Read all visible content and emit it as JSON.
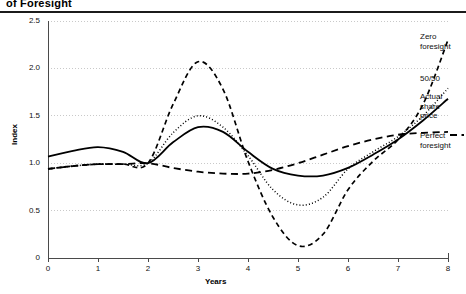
{
  "title": "of Foresight",
  "axes": {
    "xlabel": "Years",
    "ylabel": "Index",
    "yticks": [
      "0",
      "0.5",
      "1.0",
      "1.5",
      "2.0",
      "2.5"
    ],
    "xticks": [
      "0",
      "1",
      "2",
      "3",
      "4",
      "5",
      "6",
      "7",
      "8"
    ]
  },
  "legend": {
    "zero": "Zero\nforesight",
    "fifty": "50/50",
    "actual": "Actual\nshare\nprice",
    "perfect": "Perfect\nforesight"
  },
  "colors": {
    "line": "#000000",
    "grid": "#c9c9c9",
    "axis": "#4a4a4a",
    "rule": "#1b1b1b"
  },
  "chart_data": {
    "type": "line",
    "title": "of Foresight",
    "xlabel": "Years",
    "ylabel": "Index",
    "xlim": [
      0,
      8
    ],
    "ylim": [
      0,
      2.5
    ],
    "grid": true,
    "legend_position": "right",
    "x": [
      0,
      0.5,
      1,
      1.5,
      2,
      2.5,
      3,
      3.5,
      4,
      4.5,
      5,
      5.5,
      6,
      6.5,
      7,
      7.5,
      8
    ],
    "series": [
      {
        "name": "Zero foresight",
        "style": "dashed",
        "values": [
          0.94,
          0.97,
          0.99,
          0.99,
          1.0,
          1.62,
          2.07,
          1.78,
          1.02,
          0.43,
          0.13,
          0.25,
          0.72,
          1.02,
          1.25,
          1.62,
          2.3
        ]
      },
      {
        "name": "50/50",
        "style": "dotted",
        "values": [
          0.94,
          0.97,
          0.99,
          0.99,
          1.0,
          1.32,
          1.5,
          1.38,
          1.08,
          0.72,
          0.56,
          0.64,
          0.94,
          1.12,
          1.28,
          1.5,
          1.79
        ]
      },
      {
        "name": "Actual share price",
        "style": "solid",
        "values": [
          1.07,
          1.13,
          1.17,
          1.12,
          1.0,
          1.22,
          1.38,
          1.33,
          1.12,
          0.94,
          0.87,
          0.87,
          0.95,
          1.09,
          1.25,
          1.45,
          1.68
        ]
      },
      {
        "name": "Perfect foresight",
        "style": "long-dashed",
        "values": [
          0.94,
          0.97,
          0.99,
          0.99,
          1.0,
          0.95,
          0.91,
          0.89,
          0.89,
          0.93,
          1.0,
          1.09,
          1.18,
          1.25,
          1.3,
          1.32,
          1.33
        ]
      }
    ]
  }
}
